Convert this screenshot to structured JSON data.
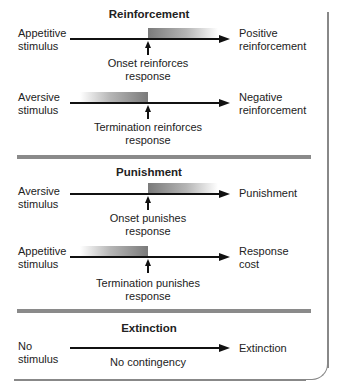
{
  "sections": {
    "reinforcement": {
      "title": "Reinforcement",
      "rows": [
        {
          "stimulus_line1": "Appetitive",
          "stimulus_line2": "stimulus",
          "result_line1": "Positive",
          "result_line2": "reinforcement",
          "caption_line1": "Onset reinforces",
          "caption_line2": "response",
          "gradient": "onset"
        },
        {
          "stimulus_line1": "Aversive",
          "stimulus_line2": "stimulus",
          "result_line1": "Negative",
          "result_line2": "reinforcement",
          "caption_line1": "Termination reinforces",
          "caption_line2": "response",
          "gradient": "termination"
        }
      ]
    },
    "punishment": {
      "title": "Punishment",
      "rows": [
        {
          "stimulus_line1": "Aversive",
          "stimulus_line2": "stimulus",
          "result_line1": "Punishment",
          "result_line2": "",
          "caption_line1": "Onset punishes",
          "caption_line2": "response",
          "gradient": "onset"
        },
        {
          "stimulus_line1": "Appetitive",
          "stimulus_line2": "stimulus",
          "result_line1": "Response",
          "result_line2": "cost",
          "caption_line1": "Termination punishes",
          "caption_line2": "response",
          "gradient": "termination"
        }
      ]
    },
    "extinction": {
      "title": "Extinction",
      "rows": [
        {
          "stimulus_line1": "No",
          "stimulus_line2": "stimulus",
          "result_line1": "Extinction",
          "caption_line1": "No contingency",
          "gradient": "none"
        }
      ]
    }
  },
  "colors": {
    "line": "#111111",
    "divider": "#8a8a8a",
    "gradient_dark": "#7a7a7a",
    "frame": "#888888"
  }
}
